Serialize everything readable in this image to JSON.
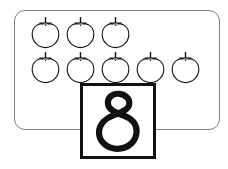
{
  "worksheet": {
    "title": "Counting worksheet: eight apples",
    "background_color": "#ffffff"
  },
  "group_frame": {
    "name": "apple-group-frame",
    "border_color": "#7d7d7d",
    "fill_color": "#ffffff",
    "corner_radius_px": 11
  },
  "apples": {
    "icon_name": "apple-icon",
    "total_count": 8,
    "total_count_label": "8",
    "outline_color": "#111111",
    "fill_color": "#ffffff",
    "rows": [
      {
        "row_label": "top row",
        "count": 3,
        "items": [
          {
            "label": "apple 1"
          },
          {
            "label": "apple 2"
          },
          {
            "label": "apple 3"
          }
        ]
      },
      {
        "row_label": "bottom row",
        "count": 5,
        "items": [
          {
            "label": "apple 4"
          },
          {
            "label": "apple 5"
          },
          {
            "label": "apple 6"
          },
          {
            "label": "apple 7"
          },
          {
            "label": "apple 8"
          }
        ]
      }
    ]
  },
  "number_card": {
    "name": "number-card",
    "value": "8",
    "border_color": "#111111",
    "fill_color": "#ffffff",
    "glyph_color": "#111111",
    "style": "hand-drawn marker"
  }
}
